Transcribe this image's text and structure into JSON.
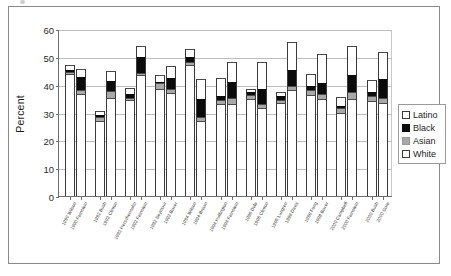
{
  "figure": {
    "ylabel": "Percent",
    "legend_position": "right"
  },
  "chart_data": {
    "type": "bar",
    "stacked": true,
    "title": "",
    "xlabel": "",
    "ylabel": "Percent",
    "ylim": [
      0,
      60
    ],
    "yticks": [
      0,
      10,
      20,
      30,
      40,
      50,
      60
    ],
    "grid": true,
    "legend": [
      "Latino",
      "Black",
      "Asian",
      "White"
    ],
    "legend_position": "right",
    "categories": [
      "1990 Wilson",
      "1990 Feinstein",
      "1992 Bush",
      "1992 Clinton",
      "1992 Herschensohn",
      "1992 Feinstein",
      "1992 Seymour",
      "1992 Boxer",
      "1994 Wilson",
      "1994 Brown",
      "1994 Huffington",
      "1994 Feinstein",
      "1996 Dole",
      "1996 Clinton",
      "1996 Lungren",
      "1998 Davis",
      "1998 Fong",
      "1998 Boxer",
      "2000 Campbell",
      "2000 Feinstein",
      "2000 Bush",
      "2000 Gore"
    ],
    "series": [
      {
        "name": "White",
        "values": [
          43.8,
          36.5,
          26.8,
          35.2,
          34.5,
          43.4,
          38.6,
          37.0,
          47.2,
          27.0,
          33.0,
          33.2,
          35.0,
          31.5,
          33.4,
          38.0,
          36.2,
          35.0,
          30.0,
          35.0,
          34.0,
          33.5
        ]
      },
      {
        "name": "Asian",
        "values": [
          0.9,
          1.5,
          1.6,
          2.6,
          0.8,
          0.9,
          1.9,
          1.6,
          1.0,
          1.3,
          1.6,
          1.9,
          1.3,
          1.7,
          1.2,
          1.5,
          1.8,
          1.5,
          1.5,
          2.2,
          2.0,
          1.8
        ]
      },
      {
        "name": "Black",
        "values": [
          0.7,
          4.8,
          0.8,
          3.5,
          1.3,
          5.8,
          0.5,
          3.7,
          1.6,
          6.4,
          1.2,
          6.0,
          0.9,
          5.3,
          1.2,
          5.9,
          1.5,
          4.2,
          0.8,
          6.2,
          1.4,
          6.6
        ]
      },
      {
        "name": "Latino",
        "values": [
          1.6,
          3.0,
          1.3,
          3.6,
          2.2,
          3.9,
          2.4,
          4.3,
          3.0,
          7.3,
          6.5,
          7.2,
          1.3,
          9.7,
          1.5,
          10.1,
          4.3,
          10.2,
          3.2,
          10.5,
          4.2,
          9.7
        ]
      }
    ]
  }
}
